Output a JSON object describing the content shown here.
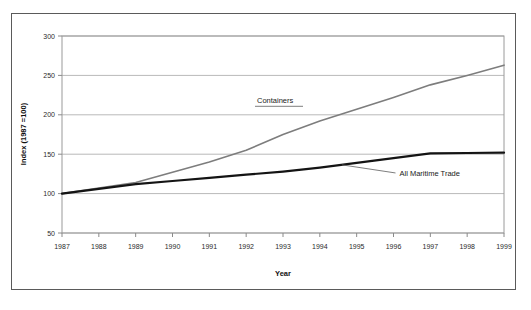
{
  "figure": {
    "background_color": "#ffffff",
    "frame_color": "#5a5a5a"
  },
  "chart_data": {
    "type": "line",
    "title": "",
    "subtitle": "",
    "xlabel": "Year",
    "ylabel": "Index (1987 =100)",
    "x": [
      1987,
      1988,
      1989,
      1990,
      1991,
      1992,
      1993,
      1994,
      1995,
      1996,
      1997,
      1998,
      1999
    ],
    "categories": [
      "1987",
      "1988",
      "1989",
      "1990",
      "1991",
      "1992",
      "1993",
      "1994",
      "1995",
      "1996",
      "1997",
      "1998",
      "1999"
    ],
    "xlim": [
      1987,
      1999
    ],
    "ylim": [
      50,
      300
    ],
    "yticks": [
      50,
      100,
      150,
      200,
      250,
      300
    ],
    "ytick_labels": [
      "50",
      "100",
      "150",
      "200",
      "250",
      "300"
    ],
    "grid": true,
    "grid_axis": "y",
    "grid_color": "#b9b9b9",
    "legend": "inline-annotations",
    "legend_position": "inside-plot",
    "series": [
      {
        "name": "Containers",
        "color": "#7d7d7d",
        "width": 1.6,
        "values": [
          100,
          107,
          114,
          127,
          140,
          155,
          175,
          192,
          207,
          222,
          238,
          250,
          263
        ]
      },
      {
        "name": "All Maritime Trade",
        "color": "#141414",
        "width": 2.2,
        "values": [
          100,
          106,
          112,
          116,
          120,
          124,
          128,
          133,
          139,
          145,
          151,
          151.5,
          152
        ]
      }
    ],
    "annotations": [
      {
        "text": "Containers",
        "series": "Containers",
        "style": "text-with-underline-leader"
      },
      {
        "text": "All Maritime Trade",
        "series": "All Maritime Trade",
        "style": "text-with-diagonal-leader"
      }
    ]
  }
}
